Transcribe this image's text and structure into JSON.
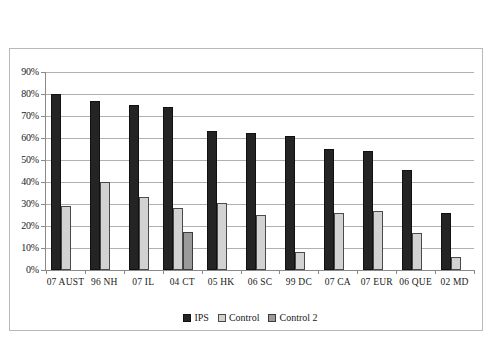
{
  "chart_data": {
    "type": "bar",
    "title": "",
    "subtitle": "",
    "xlabel": "",
    "ylabel": "",
    "ylim": [
      0,
      90
    ],
    "ytick_labels": [
      "90%",
      "80%",
      "70%",
      "60%",
      "50%",
      "40%",
      "30%",
      "20%",
      "10%",
      "0%"
    ],
    "ytick_values": [
      90,
      80,
      70,
      60,
      50,
      40,
      30,
      20,
      10,
      0
    ],
    "grid": true,
    "legend_position": "bottom",
    "categories": [
      "07  AUST",
      "96  NH",
      "07  IL",
      "04  CT",
      "05  HK",
      "06  SC",
      "99  DC",
      "07  CA",
      "07  EUR",
      "06  QUE",
      "02  MD"
    ],
    "series": [
      {
        "name": "IPS",
        "color": "#242424",
        "values": [
          80,
          77,
          75,
          74,
          63,
          62.5,
          61,
          55,
          54,
          45.5,
          26
        ]
      },
      {
        "name": "Control",
        "color": "#d2d2d2",
        "values": [
          29,
          40,
          33,
          28,
          30.5,
          25,
          8,
          26,
          27,
          17,
          6
        ]
      },
      {
        "name": "Control 2",
        "color": "#9a9a9a",
        "values": [
          null,
          null,
          null,
          17.5,
          null,
          null,
          null,
          null,
          null,
          null,
          null
        ]
      }
    ],
    "legend": [
      {
        "label": "IPS",
        "swatch": "ips"
      },
      {
        "label": "Control",
        "swatch": "control"
      },
      {
        "label": "Control 2",
        "swatch": "control2"
      }
    ]
  }
}
